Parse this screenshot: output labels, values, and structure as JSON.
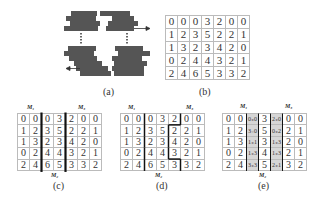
{
  "captions": {
    "a": "(a)",
    "b": "(b)",
    "c": "(c)",
    "d": "(d)",
    "e": "(e)"
  },
  "labels": {
    "m1": "M₁",
    "m2": "M₂",
    "m3": "M₃"
  },
  "matrix": [
    [
      "0",
      "0",
      "0",
      "3",
      "2",
      "0",
      "0"
    ],
    [
      "1",
      "2",
      "3",
      "5",
      "2",
      "2",
      "1"
    ],
    [
      "1",
      "3",
      "2",
      "3",
      "4",
      "2",
      "0"
    ],
    [
      "0",
      "2",
      "4",
      "4",
      "3",
      "2",
      "1"
    ],
    [
      "2",
      "4",
      "6",
      "5",
      "3",
      "3",
      "2"
    ]
  ],
  "matrix_e": [
    [
      "0",
      "0",
      "0₊0",
      "3",
      "2₊0",
      "0",
      "0"
    ],
    [
      "1",
      "2",
      "3₋0",
      "5",
      "0₊2",
      "2",
      "1"
    ],
    [
      "1",
      "3",
      "1₊1",
      "3",
      "1₊3",
      "2",
      "0"
    ],
    [
      "0",
      "2",
      "1₊3",
      "4",
      "1₊3",
      "2",
      "1"
    ],
    [
      "2",
      "4",
      "3₊3",
      "5",
      "2₊1",
      "3",
      "2"
    ]
  ],
  "seams_d": {
    "left": [
      2,
      2,
      2,
      2,
      2
    ],
    "right": [
      5,
      4,
      4,
      4,
      5
    ]
  }
}
